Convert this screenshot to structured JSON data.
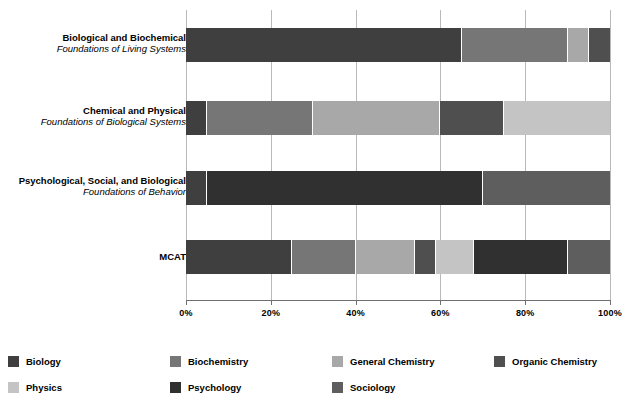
{
  "chart_data": {
    "type": "bar",
    "orientation": "horizontal",
    "stacked": true,
    "normalized_percent": true,
    "title": "",
    "subtitle": "",
    "xlabel": "",
    "ylabel": "",
    "xlim": [
      0,
      100
    ],
    "xticks": [
      0,
      20,
      40,
      60,
      80,
      100
    ],
    "xtick_labels": [
      "0%",
      "20%",
      "40%",
      "60%",
      "80%",
      "100%"
    ],
    "grid": true,
    "grid_axis": "x",
    "legend_position": "bottom",
    "legend_columns": 4,
    "categories": [
      {
        "title": "Biological and Biochemical",
        "subtitle": "Foundations of Living Systems"
      },
      {
        "title": "Chemical and Physical",
        "subtitle": "Foundations of Biological Systems"
      },
      {
        "title": "Psychological, Social, and Biological",
        "subtitle": "Foundations of Behavior"
      },
      {
        "title": "MCAT",
        "subtitle": ""
      }
    ],
    "series": [
      {
        "name": "Biology",
        "color": "#3f3f3f",
        "values": [
          65,
          5,
          5,
          25
        ]
      },
      {
        "name": "Biochemistry",
        "color": "#767676",
        "values": [
          25,
          25,
          0,
          15
        ]
      },
      {
        "name": "General Chemistry",
        "color": "#a8a8a8",
        "values": [
          5,
          30,
          0,
          14
        ]
      },
      {
        "name": "Organic Chemistry",
        "color": "#4f4f4f",
        "values": [
          5,
          15,
          0,
          5
        ]
      },
      {
        "name": "Physics",
        "color": "#c4c4c4",
        "values": [
          0,
          25,
          0,
          9
        ]
      },
      {
        "name": "Psychology",
        "color": "#303030",
        "values": [
          0,
          0,
          65,
          22
        ]
      },
      {
        "name": "Sociology",
        "color": "#5e5e5e",
        "values": [
          0,
          0,
          30,
          10
        ]
      }
    ]
  },
  "legend": {
    "items": [
      {
        "label": "Biology",
        "color": "#3f3f3f"
      },
      {
        "label": "Biochemistry",
        "color": "#767676"
      },
      {
        "label": "General Chemistry",
        "color": "#a8a8a8"
      },
      {
        "label": "Organic Chemistry",
        "color": "#4f4f4f"
      },
      {
        "label": "Physics",
        "color": "#c4c4c4"
      },
      {
        "label": "Psychology",
        "color": "#303030"
      },
      {
        "label": "Sociology",
        "color": "#5e5e5e"
      }
    ]
  },
  "axis": {
    "tick_labels": [
      "0%",
      "20%",
      "40%",
      "60%",
      "80%",
      "100%"
    ]
  }
}
